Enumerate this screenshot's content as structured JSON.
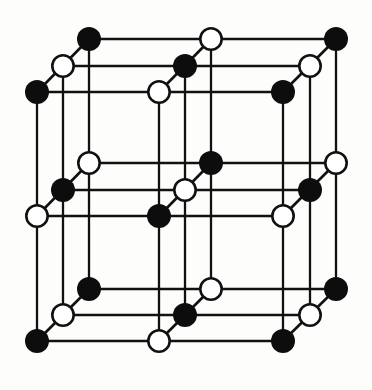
{
  "figure": {
    "name": "rock-salt-crystal-lattice",
    "background_color": "#fdfdfc",
    "canvas": {
      "width": 372,
      "height": 390
    }
  },
  "style": {
    "bond_color": "#111111",
    "bond_width": 2.3,
    "diagonal_bond_width": 2.6,
    "atom_radius": 12.0,
    "filled_atom_color": "#0d0d0d",
    "open_atom_fill": "#ffffff",
    "open_atom_stroke": "#111111",
    "open_atom_stroke_width": 2.6
  },
  "lattice": {
    "type": "rock-salt",
    "grid_size": [
      3,
      3,
      3
    ],
    "legend": {
      "filled_label": "filled circle atom (species A)",
      "open_label": "open circle atom (species B)"
    },
    "axes": {
      "x_step": 122.5,
      "y_step": 125.0,
      "depth_dx": -26.0,
      "depth_dy": 26.5
    },
    "origin": {
      "x": 89.0,
      "y": 39.0
    },
    "x_positions_front": [
      89.0,
      211.5,
      336.0
    ],
    "y_positions_front": [
      39.0,
      163.5,
      289.0
    ],
    "depth_levels": [
      0,
      1,
      2
    ],
    "column_x_all": [
      37.0,
      63.0,
      89.0,
      159.0,
      185.0,
      211.0,
      283.0,
      309.0,
      336.0
    ],
    "row_y_all": [
      39.0,
      66.0,
      92.0,
      163.0,
      190.0,
      216.0,
      289.0,
      315.0,
      341.0
    ],
    "atoms": [
      {
        "id": "a-0-0-0",
        "col": 0,
        "row": 0,
        "depth": 0,
        "cx": 89,
        "cy": 39,
        "kind": "filled"
      },
      {
        "id": "a-1-0-0",
        "col": 1,
        "row": 0,
        "depth": 0,
        "cx": 211,
        "cy": 39,
        "kind": "open"
      },
      {
        "id": "a-2-0-0",
        "col": 2,
        "row": 0,
        "depth": 0,
        "cx": 336,
        "cy": 39,
        "kind": "filled"
      },
      {
        "id": "a-0-1-0",
        "col": 0,
        "row": 1,
        "depth": 0,
        "cx": 89,
        "cy": 163,
        "kind": "open"
      },
      {
        "id": "a-1-1-0",
        "col": 1,
        "row": 1,
        "depth": 0,
        "cx": 211,
        "cy": 163,
        "kind": "filled"
      },
      {
        "id": "a-2-1-0",
        "col": 2,
        "row": 1,
        "depth": 0,
        "cx": 336,
        "cy": 163,
        "kind": "open"
      },
      {
        "id": "a-0-2-0",
        "col": 0,
        "row": 2,
        "depth": 0,
        "cx": 89,
        "cy": 289,
        "kind": "filled"
      },
      {
        "id": "a-1-2-0",
        "col": 1,
        "row": 2,
        "depth": 0,
        "cx": 211,
        "cy": 289,
        "kind": "open"
      },
      {
        "id": "a-2-2-0",
        "col": 2,
        "row": 2,
        "depth": 0,
        "cx": 336,
        "cy": 289,
        "kind": "filled"
      },
      {
        "id": "a-0-0-1",
        "col": 0,
        "row": 0,
        "depth": 1,
        "cx": 63,
        "cy": 66,
        "kind": "open"
      },
      {
        "id": "a-1-0-1",
        "col": 1,
        "row": 0,
        "depth": 1,
        "cx": 185,
        "cy": 66,
        "kind": "filled"
      },
      {
        "id": "a-2-0-1",
        "col": 2,
        "row": 0,
        "depth": 1,
        "cx": 310,
        "cy": 66,
        "kind": "open"
      },
      {
        "id": "a-0-1-1",
        "col": 0,
        "row": 1,
        "depth": 1,
        "cx": 63,
        "cy": 190,
        "kind": "filled"
      },
      {
        "id": "a-1-1-1",
        "col": 1,
        "row": 1,
        "depth": 1,
        "cx": 185,
        "cy": 190,
        "kind": "open"
      },
      {
        "id": "a-2-1-1",
        "col": 2,
        "row": 1,
        "depth": 1,
        "cx": 310,
        "cy": 190,
        "kind": "filled"
      },
      {
        "id": "a-0-2-1",
        "col": 0,
        "row": 2,
        "depth": 1,
        "cx": 63,
        "cy": 315,
        "kind": "open"
      },
      {
        "id": "a-1-2-1",
        "col": 1,
        "row": 2,
        "depth": 1,
        "cx": 185,
        "cy": 315,
        "kind": "filled"
      },
      {
        "id": "a-2-2-1",
        "col": 2,
        "row": 2,
        "depth": 1,
        "cx": 310,
        "cy": 315,
        "kind": "open"
      },
      {
        "id": "a-0-0-2",
        "col": 0,
        "row": 0,
        "depth": 2,
        "cx": 37,
        "cy": 92,
        "kind": "filled"
      },
      {
        "id": "a-1-0-2",
        "col": 1,
        "row": 0,
        "depth": 2,
        "cx": 159,
        "cy": 92,
        "kind": "open"
      },
      {
        "id": "a-2-0-2",
        "col": 2,
        "row": 0,
        "depth": 2,
        "cx": 283,
        "cy": 92,
        "kind": "filled"
      },
      {
        "id": "a-0-1-2",
        "col": 0,
        "row": 1,
        "depth": 2,
        "cx": 37,
        "cy": 216,
        "kind": "open"
      },
      {
        "id": "a-1-1-2",
        "col": 1,
        "row": 1,
        "depth": 2,
        "cx": 159,
        "cy": 216,
        "kind": "filled"
      },
      {
        "id": "a-2-1-2",
        "col": 2,
        "row": 1,
        "depth": 2,
        "cx": 283,
        "cy": 216,
        "kind": "open"
      },
      {
        "id": "a-0-2-2",
        "col": 0,
        "row": 2,
        "depth": 2,
        "cx": 37,
        "cy": 341,
        "kind": "filled"
      },
      {
        "id": "a-1-2-2",
        "col": 1,
        "row": 2,
        "depth": 2,
        "cx": 159,
        "cy": 341,
        "kind": "open"
      },
      {
        "id": "a-2-2-2",
        "col": 2,
        "row": 2,
        "depth": 2,
        "cx": 283,
        "cy": 341,
        "kind": "filled"
      }
    ],
    "bonds_horizontal": [
      {
        "x1": 89,
        "y1": 39,
        "x2": 336,
        "y2": 39
      },
      {
        "x1": 89,
        "y1": 163,
        "x2": 336,
        "y2": 163
      },
      {
        "x1": 89,
        "y1": 289,
        "x2": 336,
        "y2": 289
      },
      {
        "x1": 63,
        "y1": 66,
        "x2": 310,
        "y2": 66
      },
      {
        "x1": 63,
        "y1": 190,
        "x2": 310,
        "y2": 190
      },
      {
        "x1": 63,
        "y1": 315,
        "x2": 310,
        "y2": 315
      },
      {
        "x1": 37,
        "y1": 92,
        "x2": 283,
        "y2": 92
      },
      {
        "x1": 37,
        "y1": 216,
        "x2": 283,
        "y2": 216
      },
      {
        "x1": 37,
        "y1": 341,
        "x2": 283,
        "y2": 341
      }
    ],
    "bonds_vertical": [
      {
        "x1": 89,
        "y1": 39,
        "x2": 89,
        "y2": 289
      },
      {
        "x1": 211,
        "y1": 39,
        "x2": 211,
        "y2": 289
      },
      {
        "x1": 336,
        "y1": 39,
        "x2": 336,
        "y2": 289
      },
      {
        "x1": 63,
        "y1": 66,
        "x2": 63,
        "y2": 315
      },
      {
        "x1": 185,
        "y1": 66,
        "x2": 185,
        "y2": 315
      },
      {
        "x1": 310,
        "y1": 66,
        "x2": 310,
        "y2": 315
      },
      {
        "x1": 37,
        "y1": 92,
        "x2": 37,
        "y2": 341
      },
      {
        "x1": 159,
        "y1": 92,
        "x2": 159,
        "y2": 341
      },
      {
        "x1": 283,
        "y1": 92,
        "x2": 283,
        "y2": 341
      }
    ],
    "bonds_depth": [
      {
        "x1": 89,
        "y1": 39,
        "x2": 37,
        "y2": 92
      },
      {
        "x1": 211,
        "y1": 39,
        "x2": 159,
        "y2": 92
      },
      {
        "x1": 336,
        "y1": 39,
        "x2": 283,
        "y2": 92
      },
      {
        "x1": 89,
        "y1": 163,
        "x2": 37,
        "y2": 216
      },
      {
        "x1": 211,
        "y1": 163,
        "x2": 159,
        "y2": 216
      },
      {
        "x1": 336,
        "y1": 163,
        "x2": 283,
        "y2": 216
      },
      {
        "x1": 89,
        "y1": 289,
        "x2": 37,
        "y2": 341
      },
      {
        "x1": 211,
        "y1": 289,
        "x2": 159,
        "y2": 341
      },
      {
        "x1": 336,
        "y1": 289,
        "x2": 283,
        "y2": 341
      }
    ]
  }
}
